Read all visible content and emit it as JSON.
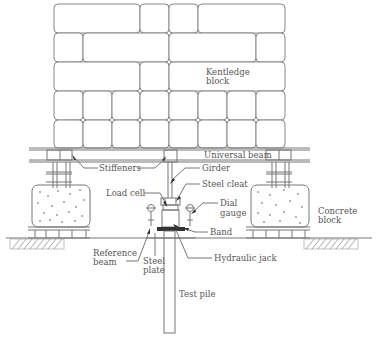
{
  "diagram": {
    "labels": {
      "kentledge": [
        "Kentledge",
        "block"
      ],
      "universal_beam": "Universal beam",
      "stiffeners": "Stiffeners",
      "girder": "Girder",
      "steel_cleat": "Steel cleat",
      "load_cell": "Load cell",
      "dial_gauge": [
        "Dial",
        "gauge"
      ],
      "concrete_block": [
        "Concrete",
        "block"
      ],
      "band": "Band",
      "reference_beam": [
        "Reference",
        "beam"
      ],
      "steel_plate": [
        "Steel",
        "plate"
      ],
      "hydraulic_jack": "Hydraulic jack",
      "test_pile": "Test pile"
    },
    "colors": {
      "line": "#777777",
      "text": "#555555",
      "background": "#ffffff"
    }
  }
}
